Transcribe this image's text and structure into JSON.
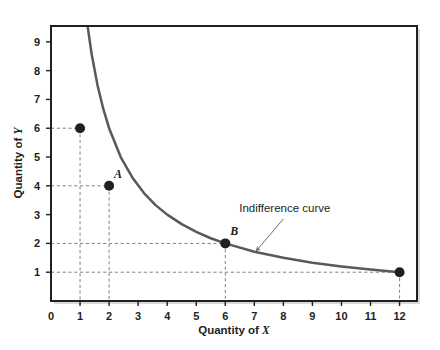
{
  "figure": {
    "background_color": "#ffffff",
    "plot_background_color": "#ffffff",
    "frame_color": "#231f20",
    "curve_color": "#58595b",
    "dashed_color": "#808285",
    "point_color": "#231f20",
    "annotation_arrow_color": "#6d6e71"
  },
  "chart_data": {
    "type": "line",
    "title": "",
    "subtitle": "",
    "xlabel": "Quantity of X",
    "ylabel": "Quantity of Y",
    "xlim": [
      0,
      12.6
    ],
    "ylim": [
      0,
      9.55
    ],
    "grid": false,
    "legend_position": "none",
    "xticks": [
      0,
      1,
      2,
      3,
      4,
      5,
      6,
      7,
      8,
      9,
      10,
      11,
      12
    ],
    "xtick_labels": [
      "0",
      "1",
      "2",
      "3",
      "4",
      "5",
      "6",
      "7",
      "8",
      "9",
      "10",
      "11",
      "12"
    ],
    "yticks": [
      1,
      2,
      3,
      4,
      5,
      6,
      7,
      8,
      9
    ],
    "ytick_labels": [
      "1",
      "2",
      "3",
      "4",
      "5",
      "6",
      "7",
      "8",
      "9"
    ],
    "series": [
      {
        "name": "Indifference curve",
        "relation": "x * y = 12",
        "x": [
          1.26,
          1.4,
          1.6,
          1.8,
          2.0,
          2.4,
          2.8,
          3.2,
          3.6,
          4.0,
          4.5,
          5.0,
          5.5,
          6.0,
          7.0,
          8.0,
          9.0,
          10.0,
          11.0,
          12.0
        ],
        "y": [
          9.55,
          8.57,
          7.5,
          6.67,
          6.0,
          5.0,
          4.29,
          3.75,
          3.33,
          3.0,
          2.67,
          2.4,
          2.18,
          2.0,
          1.71,
          1.5,
          1.33,
          1.2,
          1.09,
          1.0
        ]
      }
    ],
    "points": [
      {
        "label": "",
        "x": 1,
        "y": 6,
        "leader_lines": true
      },
      {
        "label": "A",
        "x": 2,
        "y": 4,
        "leader_lines": true
      },
      {
        "label": "B",
        "x": 6,
        "y": 2,
        "leader_lines": true
      },
      {
        "label": "",
        "x": 12,
        "y": 1,
        "leader_lines": true
      }
    ],
    "annotations": [
      {
        "text": "Indifference curve",
        "text_x": 8.05,
        "text_y": 3.1,
        "arrow_from_x": 8.0,
        "arrow_from_y": 2.85,
        "arrow_to_x": 7.05,
        "arrow_to_y": 1.72
      }
    ]
  }
}
